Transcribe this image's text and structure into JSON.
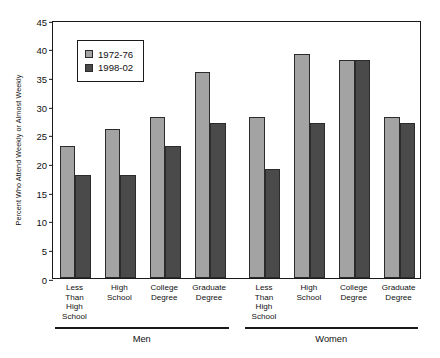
{
  "chart_data": {
    "type": "bar",
    "title": "",
    "xlabel": "",
    "ylabel": "Percent Who Attend Weekly or Almost Weekly",
    "ylim": [
      0,
      45
    ],
    "yticks": [
      0,
      5,
      10,
      15,
      20,
      25,
      30,
      35,
      40,
      45
    ],
    "grid": false,
    "legend_position": "upper-left-inside",
    "groups": [
      {
        "name": "Men",
        "categories": [
          "Less\nThan\nHigh\nSchool",
          "High\nSchool",
          "College\nDegree",
          "Graduate\nDegree"
        ]
      },
      {
        "name": "Women",
        "categories": [
          "Less\nThan\nHigh\nSchool",
          "High\nSchool",
          "College\nDegree",
          "Graduate\nDegree"
        ]
      }
    ],
    "categories": [
      "Men - Less Than High School",
      "Men - High School",
      "Men - College Degree",
      "Men - Graduate Degree",
      "Women - Less Than High School",
      "Women - High School",
      "Women - College Degree",
      "Women - Graduate Degree"
    ],
    "series": [
      {
        "name": "1972-76",
        "color": "#A3A3A3",
        "values": [
          23,
          26,
          28,
          36,
          28,
          39,
          38,
          28
        ]
      },
      {
        "name": "1998-02",
        "color": "#4A4A4A",
        "values": [
          18,
          18,
          23,
          27,
          19,
          27,
          38,
          27
        ]
      }
    ]
  },
  "legend": {
    "items": [
      {
        "label": "1972-76",
        "color": "#A3A3A3"
      },
      {
        "label": "1998-02",
        "color": "#4A4A4A"
      }
    ]
  },
  "axis": {
    "y_label": "Percent Who Attend Weekly or Almost Weekly",
    "y_ticks": [
      "45",
      "40",
      "35",
      "30",
      "25",
      "20",
      "15",
      "10",
      "5",
      "0"
    ]
  },
  "groups": [
    {
      "label": "Men"
    },
    {
      "label": "Women"
    }
  ],
  "category_labels": [
    "Less\nThan\nHigh\nSchool",
    "High\nSchool",
    "College\nDegree",
    "Graduate\nDegree",
    "Less\nThan\nHigh\nSchool",
    "High\nSchool",
    "College\nDegree",
    "Graduate\nDegree"
  ]
}
